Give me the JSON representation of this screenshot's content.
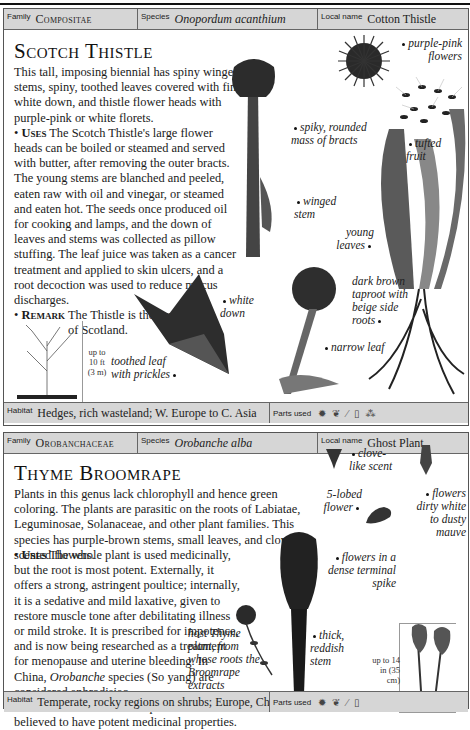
{
  "entries": [
    {
      "header": {
        "family_label": "Family",
        "family": "Compositae",
        "species_label": "Species",
        "species": "Onopordum acanthium",
        "local_label": "Local name",
        "local": "Cotton Thistle"
      },
      "title": "Scotch Thistle",
      "description": "This tall, imposing biennial has spiny winged stems, spiny, toothed leaves covered with fine white down, and thistle flower heads with purple-pink or white florets.",
      "uses_label": "Uses",
      "uses": "The Scotch Thistle's large flower heads can be boiled or steamed and served with butter, after removing the outer bracts. The young stems are blanched and peeled, eaten raw with oil and vinegar, or steamed and eaten hot. The seeds once produced oil for cooking and lamps, and the down of leaves and stems was collected as pillow stuffing. The leaf juice was taken as a cancer treatment and applied to skin ulcers, and a root decoction was used to reduce mucus discharges.",
      "remark_label": "Remark",
      "remark": "The Thistle is the emblem of Scotland.",
      "captions": {
        "flowers": "purple-pink flowers",
        "bracts": "spiky, rounded mass of bracts",
        "fruit": "tufted fruit",
        "stem": "winged stem",
        "young_leaves": "young leaves",
        "taproot": "dark brown taproot with beige side roots",
        "white_down": "white down",
        "narrow_leaf": "narrow leaf",
        "toothed_leaf": "toothed leaf with prickles"
      },
      "height_note": "up to 10 ft (3 m)",
      "footer": {
        "habitat_label": "Habitat",
        "habitat": "Hedges, rich wasteland; W. Europe to C. Asia",
        "parts_label": "Parts used",
        "parts_icons": [
          "flower-icon",
          "leaf-icon",
          "stem-icon",
          "seed-icon",
          "root-icon"
        ]
      }
    },
    {
      "header": {
        "family_label": "Family",
        "family": "Orobanchaceae",
        "species_label": "Species",
        "species": "Orobanche alba",
        "local_label": "Local name",
        "local": "Ghost Plant"
      },
      "title": "Thyme Broomrape",
      "description": "Plants in this genus lack chlorophyll and hence green coloring. The plants are parasitic on the roots of Labiatae, Leguminosae, Solanaceae, and other plant families. This species has purple-brown stems, small leaves, and clove-scented flowers.",
      "uses_label": "Uses",
      "uses_1": "The whole plant is used medicinally, but the root is most potent. Externally, it offers a strong, astringent poultice; internally, it is a sedative and mild laxative, given to restore muscle tone after debilitating illness or mild stroke. It is prescribed for impotence, and is now being researched as a treatment for menopause and uterine bleeding. In China,",
      "uses_genus": "Orobanche",
      "uses_2": "species (So yang) are considered aphrodisiac.",
      "remark_label": "Remark",
      "remark_1": "All",
      "remark_genus": "Orobanche",
      "remark_2": "species are believed to have potent medicinal properties.",
      "captions": {
        "clove": "clove-like scent",
        "lobed": "5-lobed flower",
        "dirty_white": "flowers dirty white to dusty mauve",
        "spike": "flowers in a dense terminal spike",
        "host": "host Thyme plant, from whose roots the Broomrape extracts nutrients",
        "stem": "thick, reddish stem"
      },
      "height_note": "up to 14 in (35 cm)",
      "footer": {
        "habitat_label": "Habitat",
        "habitat": "Temperate, rocky regions on shrubs; Europe, China",
        "parts_label": "Parts used",
        "parts_icons": [
          "flower-icon",
          "leaf-icon",
          "stem-icon",
          "seed-icon"
        ]
      }
    }
  ]
}
